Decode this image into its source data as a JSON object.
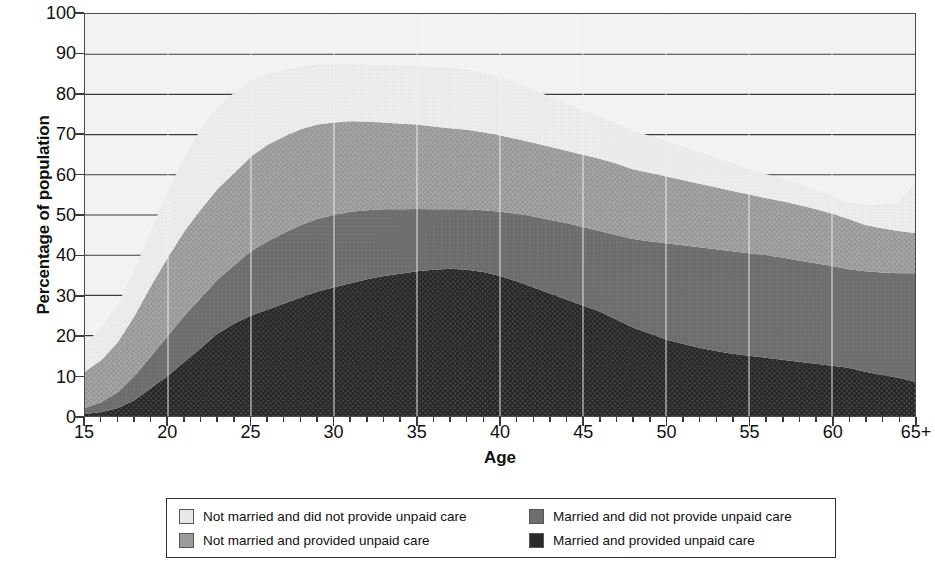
{
  "chart_data": {
    "type": "area",
    "title": "",
    "subtitle": "",
    "xlabel": "Age",
    "ylabel": "Percentage of population",
    "xlim": [
      15,
      65
    ],
    "ylim": [
      0,
      100
    ],
    "grid": true,
    "stacked": true,
    "legend_position": "bottom",
    "y_ticks": [
      0,
      10,
      20,
      30,
      40,
      50,
      60,
      70,
      80,
      90,
      100
    ],
    "x_ticks": [
      15,
      20,
      25,
      30,
      35,
      40,
      45,
      50,
      55,
      60,
      65
    ],
    "x_tick_labels": [
      "15",
      "20",
      "25",
      "30",
      "35",
      "40",
      "45",
      "50",
      "55",
      "60",
      "65+"
    ],
    "x_minor_tick_step": 1,
    "x": [
      15,
      16,
      17,
      18,
      19,
      20,
      21,
      22,
      23,
      24,
      25,
      26,
      27,
      28,
      29,
      30,
      31,
      32,
      33,
      34,
      35,
      36,
      37,
      38,
      39,
      40,
      41,
      42,
      43,
      44,
      45,
      46,
      47,
      48,
      49,
      50,
      51,
      52,
      53,
      54,
      55,
      56,
      57,
      58,
      59,
      60,
      61,
      62,
      63,
      64,
      65
    ],
    "series": [
      {
        "name": "Married and provided unpaid care",
        "color": "#2a2a2a",
        "pattern": "dense-dots",
        "values": [
          0.5,
          1.0,
          2.0,
          4.0,
          7.0,
          10.0,
          13.5,
          17.0,
          20.5,
          23.0,
          25.0,
          26.5,
          28.0,
          29.5,
          31.0,
          32.0,
          33.0,
          34.0,
          34.8,
          35.4,
          36.0,
          36.4,
          36.6,
          36.4,
          35.8,
          34.8,
          33.5,
          32.0,
          30.5,
          29.0,
          27.5,
          26.0,
          24.0,
          22.0,
          20.5,
          19.0,
          18.0,
          17.0,
          16.2,
          15.5,
          15.0,
          14.5,
          14.0,
          13.5,
          13.0,
          12.5,
          12.0,
          11.0,
          10.2,
          9.5,
          8.5
        ]
      },
      {
        "name": "Married and did not provide unpaid care",
        "color": "#6e6e6e",
        "pattern": "solid",
        "values": [
          1.5,
          2.5,
          4.0,
          6.0,
          8.0,
          10.0,
          11.5,
          12.5,
          13.5,
          14.5,
          16.0,
          17.0,
          17.5,
          18.0,
          18.0,
          18.0,
          17.8,
          17.2,
          16.6,
          16.0,
          15.5,
          15.0,
          14.8,
          15.0,
          15.4,
          16.0,
          16.8,
          17.6,
          18.3,
          19.0,
          19.5,
          20.0,
          21.0,
          22.0,
          23.0,
          24.0,
          24.5,
          25.0,
          25.3,
          25.5,
          25.5,
          25.5,
          25.4,
          25.2,
          25.0,
          24.8,
          24.5,
          25.0,
          25.5,
          26.0,
          27.0
        ]
      },
      {
        "name": "Not married and provided unpaid care",
        "color": "#9b9b9b",
        "pattern": "fine-hatch",
        "values": [
          9.0,
          10.5,
          12.5,
          15.0,
          17.5,
          19.5,
          21.0,
          22.0,
          22.5,
          23.0,
          23.5,
          24.0,
          24.0,
          23.8,
          23.5,
          23.0,
          22.5,
          22.0,
          21.6,
          21.3,
          21.0,
          20.6,
          20.2,
          19.8,
          19.4,
          19.0,
          18.6,
          18.4,
          18.2,
          18.0,
          18.0,
          18.0,
          17.8,
          17.4,
          17.0,
          16.6,
          16.2,
          15.8,
          15.4,
          15.0,
          14.6,
          14.2,
          14.0,
          13.8,
          13.5,
          13.0,
          12.5,
          11.5,
          11.0,
          10.5,
          10.0
        ]
      },
      {
        "name": "Not married and did not provide unpaid care",
        "color": "#e8e8e8",
        "pattern": "light-speckle",
        "values": [
          7.0,
          8.0,
          9.5,
          11.5,
          14.0,
          16.5,
          18.5,
          20.0,
          20.5,
          20.0,
          19.0,
          17.5,
          16.5,
          15.5,
          15.0,
          14.5,
          14.3,
          14.2,
          14.2,
          14.3,
          14.5,
          14.8,
          15.0,
          15.0,
          14.8,
          14.5,
          14.0,
          13.2,
          12.5,
          11.8,
          11.0,
          10.5,
          10.0,
          9.6,
          9.2,
          8.8,
          8.3,
          7.8,
          7.3,
          6.8,
          6.4,
          6.0,
          5.6,
          5.2,
          4.8,
          4.5,
          4.2,
          5.0,
          6.0,
          7.0,
          12.5
        ]
      }
    ],
    "legend": [
      {
        "label": "Not married and did not provide unpaid care",
        "swatch": "light-speckle",
        "color": "#e8e8e8"
      },
      {
        "label": "Married and did not provide unpaid care",
        "swatch": "solid",
        "color": "#6e6e6e"
      },
      {
        "label": "Not married and provided unpaid care",
        "swatch": "fine-hatch",
        "color": "#9b9b9b"
      },
      {
        "label": "Married and provided unpaid care",
        "swatch": "dense-dots",
        "color": "#2a2a2a"
      }
    ],
    "notes": {
      "total_peak_percent": 80,
      "total_peak_age_range": "34-38",
      "total_at_age_15": 18,
      "total_at_age_65plus": 58
    }
  },
  "axis": {
    "y_title": "Percentage of population",
    "x_title": "Age"
  },
  "legend": {
    "items": [
      {
        "label": "Not married and did not provide unpaid care"
      },
      {
        "label": "Married and did not provide unpaid care"
      },
      {
        "label": "Not married and provided unpaid care"
      },
      {
        "label": "Married and provided unpaid care"
      }
    ]
  }
}
